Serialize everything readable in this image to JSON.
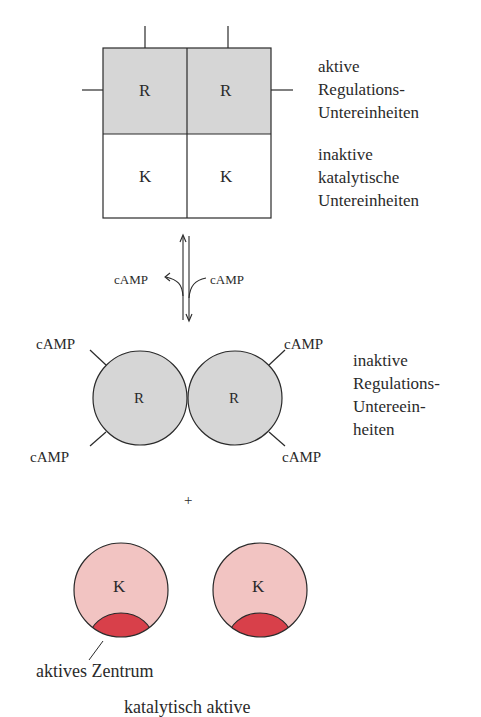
{
  "diagram": {
    "colors": {
      "regulatory_fill": "#d6d6d6",
      "catalytic_fill_inactive": "#ffffff",
      "catalytic_fill_free": "#f2c4c2",
      "active_site_fill": "#d8404a",
      "line": "#2a2a2a"
    },
    "complex": {
      "cells": [
        {
          "label": "R"
        },
        {
          "label": "R"
        },
        {
          "label": "K"
        },
        {
          "label": "K"
        }
      ],
      "label_regulatory": [
        "aktive",
        "Regulations-",
        "Untereinheiten"
      ],
      "label_catalytic": [
        "inaktive",
        "katalytische",
        "Untereinheiten"
      ]
    },
    "equilibrium": {
      "left_label": "cAMP",
      "right_label": "cAMP"
    },
    "regulatory_dimer": {
      "subunits": [
        {
          "label": "R"
        },
        {
          "label": "R"
        }
      ],
      "camp_labels": [
        "cAMP",
        "cAMP",
        "cAMP",
        "cAMP"
      ],
      "label": [
        "inaktive",
        "Regulations-",
        "Untereein-",
        "heiten"
      ]
    },
    "plus_sign": "+",
    "catalytic_subunits": [
      {
        "label": "K"
      },
      {
        "label": "K"
      }
    ],
    "active_site_label": "aktives Zentrum",
    "bottom_caption_cut": "katalytisch aktive"
  }
}
